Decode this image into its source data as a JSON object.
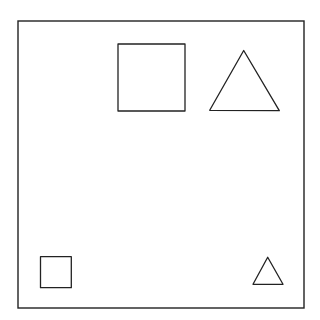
{
  "canvas": {
    "width": 320,
    "height": 320,
    "background": "#ffffff"
  },
  "stroke_color": "#222222",
  "frame": {
    "x": 18,
    "y": 21,
    "width": 286,
    "height": 287,
    "stroke_width": 1.4
  },
  "shapes": [
    {
      "type": "square",
      "size": "large",
      "position": "top-center-right",
      "x": 118,
      "y": 44,
      "width": 67,
      "height": 67
    },
    {
      "type": "triangle",
      "size": "large",
      "position": "top-right",
      "points": "243.7,50.5 209.7,110.3 279.3,110.7"
    },
    {
      "type": "square",
      "size": "small",
      "position": "bottom-left",
      "x": 40.5,
      "y": 256.7,
      "width": 30.8,
      "height": 31
    },
    {
      "type": "triangle",
      "size": "small",
      "position": "bottom-right",
      "points": "267.7,257.3 253,284.3 283,284.3"
    }
  ]
}
